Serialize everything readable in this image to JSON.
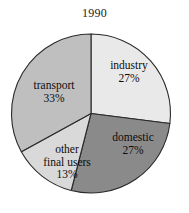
{
  "chart_data": {
    "type": "pie",
    "title": "1990",
    "subtitle": "",
    "xlabel": "",
    "ylabel": "",
    "grid": false,
    "legend": "none",
    "labels_inside_slices": true,
    "start_angle_deg": 0,
    "direction": "clockwise",
    "categories": [
      "industry",
      "domestic",
      "other final users",
      "transport"
    ],
    "values": [
      27,
      27,
      13,
      33
    ],
    "units": "%",
    "total": 100,
    "slices": [
      {
        "name": "industry",
        "label_line1": "industry",
        "label_line2": "",
        "value": 27,
        "value_text": "27%",
        "color": "#e9e9e9",
        "start_deg": 0,
        "end_deg": 97.2
      },
      {
        "name": "domestic",
        "label_line1": "domestic",
        "label_line2": "",
        "value": 27,
        "value_text": "27%",
        "color": "#8a8a8a",
        "start_deg": 97.2,
        "end_deg": 194.4
      },
      {
        "name": "other final users",
        "label_line1": "other",
        "label_line2": "final users",
        "value": 13,
        "value_text": "13%",
        "color": "#d9d9d9",
        "start_deg": 194.4,
        "end_deg": 241.2
      },
      {
        "name": "transport",
        "label_line1": "transport",
        "label_line2": "",
        "value": 33,
        "value_text": "33%",
        "color": "#bfbfbf",
        "start_deg": 241.2,
        "end_deg": 360
      }
    ],
    "stroke_color": "#2a2a2a",
    "background_color": "#ffffff"
  }
}
